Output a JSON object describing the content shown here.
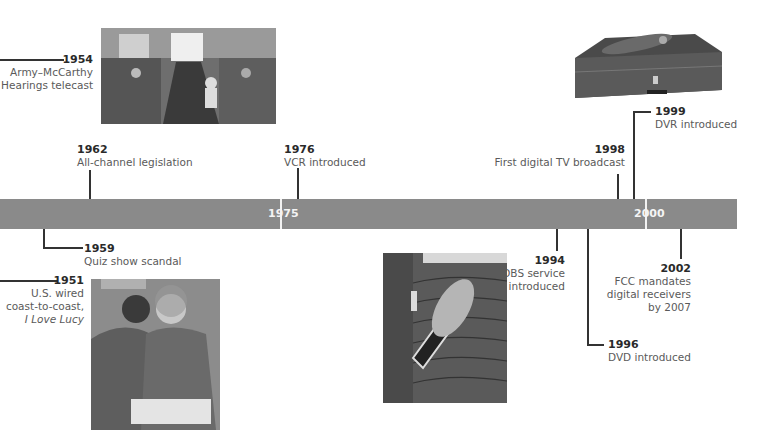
{
  "timeline": {
    "bar_color": "#8a8a8a",
    "markers": [
      {
        "label": "1975"
      },
      {
        "label": "2000"
      }
    ]
  },
  "events": [
    {
      "year": "1954",
      "text_lines": [
        "Army–McCarthy",
        "Hearings telecast"
      ]
    },
    {
      "year": "1962",
      "text_lines": [
        "All-channel legislation"
      ]
    },
    {
      "year": "1976",
      "text_lines": [
        "VCR introduced"
      ]
    },
    {
      "year": "1998",
      "text_lines": [
        "First digital TV broadcast"
      ]
    },
    {
      "year": "1999",
      "text_lines": [
        "DVR introduced"
      ]
    },
    {
      "year": "1959",
      "text_lines": [
        "Quiz show scandal"
      ]
    },
    {
      "year": "1951",
      "text_lines": [
        "U.S. wired",
        "coast-to-coast,",
        "I Love Lucy"
      ]
    },
    {
      "year": "1994",
      "text_lines": [
        "DBS service",
        "introduced"
      ]
    },
    {
      "year": "1996",
      "text_lines": [
        "DVD introduced"
      ]
    },
    {
      "year": "2002",
      "text_lines": [
        "FCC mandates",
        "digital receivers",
        "by 2007"
      ]
    }
  ],
  "photos": [
    {
      "subject": "Army–McCarthy hearings room"
    },
    {
      "subject": "I Love Lucy couple"
    },
    {
      "subject": "Satellite dish on roof"
    },
    {
      "subject": "DVR box with remote"
    }
  ]
}
